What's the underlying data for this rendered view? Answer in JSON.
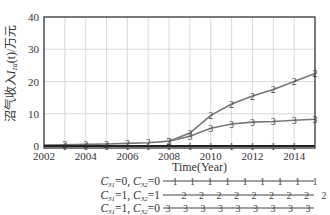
{
  "chart_data": {
    "type": "line",
    "title": "",
    "xlabel": "Time(Year)",
    "ylabel": "沼气收入 I_za(t) / 万元",
    "xlim": [
      2002,
      2015
    ],
    "ylim": [
      0,
      40
    ],
    "x_ticks": [
      "2002",
      "2004",
      "2006",
      "2008",
      "2010",
      "2012",
      "2014"
    ],
    "y_ticks": [
      "0",
      "10",
      "20",
      "30",
      "40"
    ],
    "grid": true,
    "legend_position": "bottom",
    "x": [
      2003,
      2004,
      2005,
      2006,
      2007,
      2008,
      2009,
      2010,
      2011,
      2012,
      2013,
      2014,
      2015
    ],
    "series": [
      {
        "name": "C31=0, C32=0",
        "marker": "1",
        "color": "#222222",
        "width": 2.2,
        "x": [
          2002,
          2003,
          2004,
          2005,
          2006,
          2007,
          2008,
          2009,
          2010,
          2011,
          2012,
          2013,
          2014,
          2015
        ],
        "values": [
          0,
          0,
          0,
          0,
          0,
          0,
          0,
          0,
          0,
          0,
          0,
          0,
          0,
          0
        ]
      },
      {
        "name": "C31=1, C32=1",
        "marker": "2",
        "color": "#777777",
        "width": 1.6,
        "x": [
          2002,
          2003,
          2004,
          2005,
          2006,
          2007,
          2008,
          2009,
          2010,
          2011,
          2012,
          2013,
          2014,
          2015
        ],
        "values": [
          0.3,
          0.4,
          0.5,
          0.6,
          0.8,
          1.0,
          1.5,
          4.0,
          9.5,
          13.0,
          15.5,
          17.5,
          20.0,
          22.5
        ]
      },
      {
        "name": "C31=1, C32=0",
        "marker": "3",
        "color": "#777777",
        "width": 1.6,
        "x": [
          2008,
          2009,
          2010,
          2011,
          2012,
          2013,
          2014,
          2015
        ],
        "values": [
          1.5,
          3.0,
          5.5,
          6.8,
          7.4,
          7.6,
          8.0,
          8.3
        ]
      }
    ]
  },
  "legend": {
    "items": [
      {
        "label_a": "C",
        "sub_a": "31",
        "val_a": "=0, ",
        "label_b": "C",
        "sub_b": "32",
        "val_b": "=0",
        "marker": "1"
      },
      {
        "label_a": "C",
        "sub_a": "31",
        "val_a": "=1, ",
        "label_b": "C",
        "sub_b": "32",
        "val_b": "=1",
        "marker": "2"
      },
      {
        "label_a": "C",
        "sub_a": "31",
        "val_a": "=1, ",
        "label_b": "C",
        "sub_b": "32",
        "val_b": "=0",
        "marker": "3"
      }
    ]
  },
  "axis": {
    "ylabel_main": "沼气收入",
    "ylabel_var": "I",
    "ylabel_sub": "za",
    "ylabel_rest": "(t)/万元"
  }
}
